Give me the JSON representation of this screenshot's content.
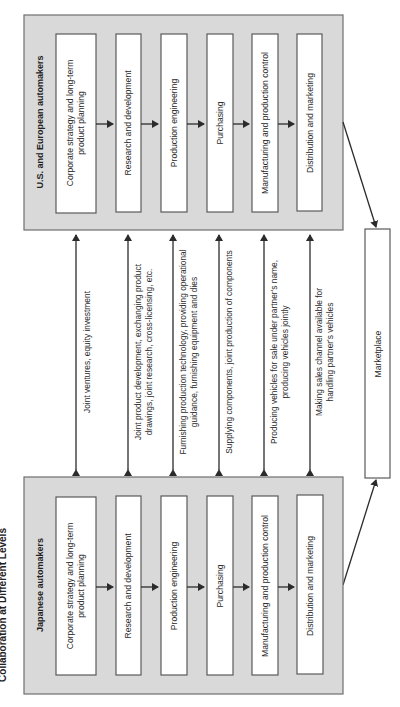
{
  "title": "Collaboration at Different Levels",
  "us_panel": {
    "label": "U.S. and European automakers",
    "steps": [
      {
        "line1": "Corporate strategy and long-term",
        "line2": "product planning"
      },
      {
        "line1": "Research and development"
      },
      {
        "line1": "Production engineering"
      },
      {
        "line1": "Purchasing"
      },
      {
        "line1": "Manufacturing and production control"
      },
      {
        "line1": "Distribution and marketing"
      }
    ]
  },
  "japan_panel": {
    "label": "Japanese automakers",
    "steps": [
      {
        "line1": "Corporate strategy and long-term",
        "line2": "product planning"
      },
      {
        "line1": "Research and development"
      },
      {
        "line1": "Production engineering"
      },
      {
        "line1": "Purchasing"
      },
      {
        "line1": "Manufacturing and production control"
      },
      {
        "line1": "Distribution and marketing"
      }
    ]
  },
  "links": [
    {
      "line1": "Joint ventures, equity investment"
    },
    {
      "line1": "Joint product development, exchanging product",
      "line2": "drawings, joint research, cross-licensing, etc."
    },
    {
      "line1": "Furnishing production technology, providing operational",
      "line2": "guidance, furnishing equipment and dies"
    },
    {
      "line1": "Supplying components, joint production of components"
    },
    {
      "line1": "Producing vehicles for sale under partner's name,",
      "line2": "producing vehicles jointly"
    },
    {
      "line1": "Making sales channel available for",
      "line2": "handling partner's vehicles"
    }
  ],
  "marketplace": {
    "label": "Marketplace"
  },
  "colors": {
    "panel_fill": "#d9d9d9",
    "box_fill": "#ffffff",
    "line": "#2b2b2b"
  }
}
